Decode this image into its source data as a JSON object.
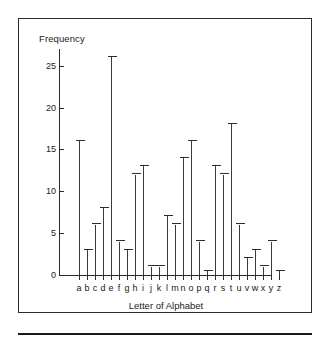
{
  "chart_data": {
    "type": "bar",
    "title": "",
    "xlabel": "Letter of Alphabet",
    "ylabel": "Frequency",
    "categories": [
      "a",
      "b",
      "c",
      "d",
      "e",
      "f",
      "g",
      "h",
      "i",
      "j",
      "k",
      "l",
      "m",
      "n",
      "o",
      "p",
      "q",
      "r",
      "s",
      "t",
      "u",
      "v",
      "w",
      "x",
      "y",
      "z"
    ],
    "values": [
      16,
      3,
      6,
      8,
      26,
      4,
      3,
      12,
      13,
      1,
      1,
      7,
      6,
      14,
      16,
      4,
      0.5,
      13,
      12,
      18,
      6,
      2,
      3,
      1,
      4,
      0.5
    ],
    "ylim": [
      0,
      27
    ],
    "yticks": [
      0,
      5,
      10,
      15,
      20,
      25
    ],
    "ytick_labels": [
      "0",
      "5",
      "10",
      "15",
      "20",
      "25"
    ],
    "xlim": [
      0,
      26
    ],
    "grid": false,
    "legend": false,
    "series_color": "#3a3a3a",
    "axis_color": "#2b2b2b",
    "background": "#ffffff",
    "marker_style": "T-cap vertical line"
  }
}
